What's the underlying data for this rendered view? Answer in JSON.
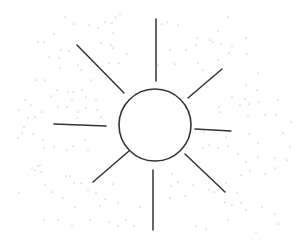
{
  "drawing": {
    "subject": "sun",
    "background": "#ffffff",
    "stroke_color": "#333333",
    "dot_color": "#9a9a9a",
    "circle": {
      "cx": 155,
      "cy": 125,
      "r": 36
    },
    "rays": [
      {
        "name": "ray-top",
        "x1": 156,
        "y1": 19,
        "x2": 156,
        "y2": 81
      },
      {
        "name": "ray-top-left",
        "x1": 77,
        "y1": 45,
        "x2": 124,
        "y2": 93
      },
      {
        "name": "ray-top-right",
        "x1": 222,
        "y1": 69,
        "x2": 188,
        "y2": 98
      },
      {
        "name": "ray-left",
        "x1": 54,
        "y1": 124,
        "x2": 106,
        "y2": 126
      },
      {
        "name": "ray-right",
        "x1": 195,
        "y1": 129,
        "x2": 231,
        "y2": 131
      },
      {
        "name": "ray-bottom-left",
        "x1": 93,
        "y1": 182,
        "x2": 129,
        "y2": 151
      },
      {
        "name": "ray-bottom-right",
        "x1": 185,
        "y1": 154,
        "x2": 225,
        "y2": 192
      },
      {
        "name": "ray-bottom",
        "x1": 153,
        "y1": 170,
        "x2": 153,
        "y2": 230
      }
    ],
    "dots": [
      [
        65,
        17
      ],
      [
        74,
        24
      ],
      [
        105,
        22
      ],
      [
        116,
        17
      ],
      [
        120,
        14
      ],
      [
        98,
        28
      ],
      [
        89,
        25
      ],
      [
        113,
        33
      ],
      [
        112,
        23
      ],
      [
        54,
        34
      ],
      [
        44,
        42
      ],
      [
        38,
        42
      ],
      [
        61,
        50
      ],
      [
        69,
        51
      ],
      [
        59,
        58
      ],
      [
        49,
        57
      ],
      [
        60,
        68
      ],
      [
        81,
        70
      ],
      [
        78,
        65
      ],
      [
        36,
        80
      ],
      [
        45,
        80
      ],
      [
        57,
        90
      ],
      [
        68,
        92
      ],
      [
        73,
        92
      ],
      [
        51,
        96
      ],
      [
        72,
        100
      ],
      [
        86,
        97
      ],
      [
        96,
        100
      ],
      [
        82,
        90
      ],
      [
        91,
        80
      ],
      [
        109,
        63
      ],
      [
        111,
        45
      ],
      [
        101,
        43
      ],
      [
        113,
        48
      ],
      [
        119,
        63
      ],
      [
        127,
        54
      ],
      [
        31,
        105
      ],
      [
        42,
        112
      ],
      [
        35,
        117
      ],
      [
        58,
        107
      ],
      [
        67,
        107
      ],
      [
        78,
        112
      ],
      [
        86,
        108
      ],
      [
        97,
        110
      ],
      [
        25,
        100
      ],
      [
        19,
        110
      ],
      [
        28,
        118
      ],
      [
        77,
        118
      ],
      [
        101,
        117
      ],
      [
        162,
        24
      ],
      [
        178,
        25
      ],
      [
        167,
        22
      ],
      [
        228,
        17
      ],
      [
        218,
        31
      ],
      [
        197,
        38
      ],
      [
        213,
        42
      ],
      [
        232,
        46
      ],
      [
        170,
        50
      ],
      [
        186,
        50
      ],
      [
        196,
        45
      ],
      [
        210,
        40
      ],
      [
        221,
        44
      ],
      [
        229,
        53
      ],
      [
        218,
        60
      ],
      [
        246,
        38
      ],
      [
        198,
        63
      ],
      [
        203,
        70
      ],
      [
        175,
        64
      ],
      [
        158,
        65
      ],
      [
        247,
        54
      ],
      [
        258,
        73
      ],
      [
        246,
        85
      ],
      [
        257,
        90
      ],
      [
        245,
        99
      ],
      [
        240,
        105
      ],
      [
        219,
        107
      ],
      [
        249,
        104
      ],
      [
        259,
        102
      ],
      [
        278,
        100
      ],
      [
        232,
        97
      ],
      [
        190,
        103
      ],
      [
        186,
        108
      ],
      [
        220,
        112
      ],
      [
        276,
        115
      ],
      [
        248,
        116
      ],
      [
        265,
        115
      ],
      [
        24,
        127
      ],
      [
        22,
        133
      ],
      [
        33,
        134
      ],
      [
        43,
        140
      ],
      [
        18,
        138
      ],
      [
        54,
        147
      ],
      [
        67,
        150
      ],
      [
        73,
        146
      ],
      [
        88,
        150
      ],
      [
        85,
        140
      ],
      [
        44,
        148
      ],
      [
        40,
        165
      ],
      [
        38,
        166
      ],
      [
        35,
        170
      ],
      [
        41,
        172
      ],
      [
        45,
        185
      ],
      [
        52,
        192
      ],
      [
        66,
        176
      ],
      [
        70,
        176
      ],
      [
        74,
        183
      ],
      [
        81,
        183
      ],
      [
        88,
        190
      ],
      [
        96,
        193
      ],
      [
        113,
        184
      ],
      [
        118,
        203
      ],
      [
        105,
        199
      ],
      [
        100,
        206
      ],
      [
        75,
        207
      ],
      [
        63,
        198
      ],
      [
        44,
        220
      ],
      [
        58,
        220
      ],
      [
        72,
        226
      ],
      [
        90,
        220
      ],
      [
        109,
        222
      ],
      [
        118,
        226
      ],
      [
        126,
        220
      ],
      [
        134,
        226
      ],
      [
        140,
        207
      ],
      [
        19,
        193
      ],
      [
        32,
        168
      ],
      [
        204,
        132
      ],
      [
        226,
        137
      ],
      [
        249,
        134
      ],
      [
        258,
        143
      ],
      [
        283,
        133
      ],
      [
        290,
        147
      ],
      [
        275,
        158
      ],
      [
        203,
        148
      ],
      [
        209,
        145
      ],
      [
        218,
        148
      ],
      [
        228,
        146
      ],
      [
        238,
        154
      ],
      [
        246,
        162
      ],
      [
        258,
        157
      ],
      [
        265,
        174
      ],
      [
        275,
        168
      ],
      [
        250,
        171
      ],
      [
        241,
        175
      ],
      [
        241,
        203
      ],
      [
        246,
        210
      ],
      [
        262,
        207
      ],
      [
        275,
        214
      ],
      [
        228,
        220
      ],
      [
        206,
        229
      ],
      [
        196,
        226
      ],
      [
        170,
        198
      ],
      [
        171,
        186
      ],
      [
        172,
        174
      ],
      [
        178,
        182
      ],
      [
        193,
        185
      ],
      [
        185,
        196
      ],
      [
        209,
        190
      ],
      [
        214,
        192
      ],
      [
        225,
        202
      ],
      [
        232,
        205
      ],
      [
        226,
        183
      ],
      [
        237,
        193
      ],
      [
        278,
        224
      ],
      [
        256,
        232
      ],
      [
        291,
        122
      ],
      [
        287,
        160
      ]
    ]
  }
}
